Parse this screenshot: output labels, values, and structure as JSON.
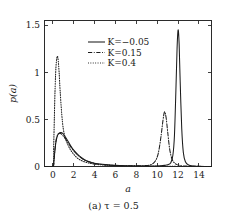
{
  "figure": {
    "caption": "(a) τ = 0.5",
    "caption_prefix": "(a)",
    "caption_value": "τ = 0.5"
  },
  "chart_data": {
    "type": "line",
    "title": "",
    "xlabel": "a",
    "ylabel": "p(a)",
    "xlim": [
      -0.8,
      15.2
    ],
    "ylim": [
      0,
      1.55
    ],
    "xticks": [
      0,
      2,
      4,
      6,
      8,
      10,
      12,
      14
    ],
    "xticklabels": [
      "0",
      "2",
      "4",
      "6",
      "8",
      "10",
      "12",
      "14"
    ],
    "yticks": [
      0,
      0.5,
      1,
      1.5
    ],
    "yticklabels": [
      "0",
      "0.5",
      "1",
      "1.5"
    ],
    "grid": false,
    "legend_position": "upper-center",
    "series": [
      {
        "name": "K = -0.05",
        "label": "K=−0.05",
        "style": "solid",
        "peaks": [
          {
            "x": 0.8,
            "y": 0.36
          },
          {
            "x": 12.0,
            "y": 1.45
          }
        ],
        "x": [
          -0.8,
          0.0,
          0.1,
          0.2,
          0.3,
          0.45,
          0.6,
          0.8,
          1.0,
          1.25,
          1.5,
          1.8,
          2.1,
          2.5,
          3.0,
          3.5,
          4.0,
          4.5,
          5.0,
          6.0,
          7.0,
          8.0,
          9.0,
          9.8,
          10.3,
          10.7,
          11.0,
          11.3,
          11.5,
          11.65,
          11.8,
          11.9,
          12.0,
          12.1,
          12.2,
          12.35,
          12.5,
          12.7,
          13.0,
          13.5,
          14.0,
          15.2
        ],
        "y": [
          0.0,
          0.0,
          0.06,
          0.17,
          0.26,
          0.33,
          0.355,
          0.36,
          0.345,
          0.305,
          0.26,
          0.205,
          0.16,
          0.115,
          0.075,
          0.05,
          0.035,
          0.026,
          0.02,
          0.012,
          0.008,
          0.006,
          0.005,
          0.006,
          0.008,
          0.012,
          0.018,
          0.04,
          0.12,
          0.33,
          0.85,
          1.25,
          1.45,
          1.3,
          0.9,
          0.4,
          0.15,
          0.05,
          0.015,
          0.005,
          0.002,
          0.0
        ]
      },
      {
        "name": "K = 0.15",
        "label": "K=0.15",
        "style": "dash-dot",
        "peaks": [
          {
            "x": 0.75,
            "y": 0.35
          },
          {
            "x": 10.7,
            "y": 0.58
          }
        ],
        "x": [
          -0.8,
          0.0,
          0.1,
          0.2,
          0.3,
          0.45,
          0.6,
          0.75,
          0.95,
          1.2,
          1.5,
          1.8,
          2.1,
          2.5,
          3.0,
          3.5,
          4.0,
          4.5,
          5.0,
          6.0,
          7.0,
          8.0,
          8.8,
          9.4,
          9.8,
          10.1,
          10.35,
          10.55,
          10.7,
          10.85,
          11.0,
          11.2,
          11.45,
          11.8,
          12.2,
          12.8,
          13.5,
          14.2,
          15.2
        ],
        "y": [
          0.0,
          0.0,
          0.06,
          0.18,
          0.275,
          0.335,
          0.35,
          0.35,
          0.33,
          0.295,
          0.245,
          0.195,
          0.155,
          0.11,
          0.07,
          0.048,
          0.033,
          0.024,
          0.019,
          0.011,
          0.008,
          0.007,
          0.009,
          0.02,
          0.055,
          0.14,
          0.31,
          0.49,
          0.58,
          0.52,
          0.37,
          0.18,
          0.07,
          0.025,
          0.01,
          0.004,
          0.002,
          0.001,
          0.0
        ]
      },
      {
        "name": "K = 0.4",
        "label": "K=0.4",
        "style": "dotted",
        "peaks": [
          {
            "x": 0.45,
            "y": 1.17
          }
        ],
        "x": [
          -0.8,
          0.0,
          0.08,
          0.15,
          0.22,
          0.3,
          0.38,
          0.45,
          0.52,
          0.6,
          0.7,
          0.85,
          1.0,
          1.2,
          1.45,
          1.7,
          2.0,
          2.4,
          2.9,
          3.4,
          4.0,
          4.6,
          5.2,
          6.0,
          7.0,
          8.0,
          9.0,
          10.0,
          11.0,
          12.0,
          13.0,
          14.0,
          15.2
        ],
        "y": [
          0.0,
          0.0,
          0.22,
          0.55,
          0.85,
          1.06,
          1.15,
          1.17,
          1.12,
          1.0,
          0.8,
          0.56,
          0.4,
          0.3,
          0.23,
          0.175,
          0.13,
          0.085,
          0.055,
          0.038,
          0.025,
          0.018,
          0.013,
          0.009,
          0.006,
          0.004,
          0.003,
          0.002,
          0.002,
          0.001,
          0.001,
          0.0,
          0.0
        ]
      }
    ]
  }
}
